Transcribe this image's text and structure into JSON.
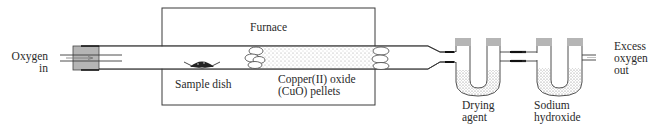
{
  "diagram": {
    "type": "combustion-analysis-apparatus",
    "labels": {
      "oxygen_in": [
        "Oxygen",
        "in"
      ],
      "furnace": "Furnace",
      "sample_dish": "Sample dish",
      "cuo_pellets": [
        "Copper(II) oxide",
        "(CuO) pellets"
      ],
      "drying_agent": [
        "Drying",
        "agent"
      ],
      "sodium_hydroxide": [
        "Sodium",
        "hydroxide"
      ],
      "excess_oxygen_out": [
        "Excess",
        "oxygen",
        "out"
      ]
    },
    "colors": {
      "line": "#3a3a3a",
      "stopper": "#b5b5b5",
      "connector": "#222222",
      "stipple": "#8a8a8a"
    }
  }
}
